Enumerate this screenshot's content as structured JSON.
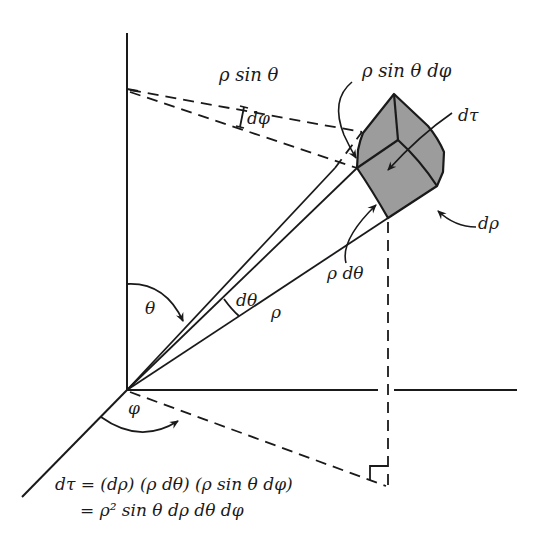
{
  "figure": {
    "colors": {
      "ink": "#1a1a1a",
      "volume_fill": "#9c9c9c",
      "background": "#ffffff"
    }
  },
  "labels": {
    "rho_sin_theta": "ρ sin θ",
    "d_phi": "dφ",
    "rho_sin_theta_d_phi": "ρ sin θ dφ",
    "d_tau": "dτ",
    "d_rho": "dρ",
    "rho_d_theta": "ρ dθ",
    "theta": "θ",
    "d_theta": "dθ",
    "rho": "ρ",
    "phi": "φ"
  },
  "equation": {
    "line1": "dτ = (dρ) (ρ dθ) (ρ sin θ dφ)",
    "line2": "= ρ² sin θ dρ dθ dφ"
  }
}
